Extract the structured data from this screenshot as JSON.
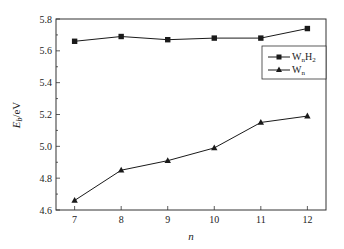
{
  "chart_data": {
    "type": "line",
    "title": "",
    "xlabel": "n",
    "ylabel": "E_b/eV",
    "x": [
      7,
      8,
      9,
      10,
      11,
      12
    ],
    "xlim": [
      6.6,
      12.4
    ],
    "ylim": [
      4.6,
      5.8
    ],
    "xticks": [
      "7",
      "8",
      "9",
      "10",
      "11",
      "12"
    ],
    "yticks": [
      "4.6",
      "4.8",
      "5.0",
      "5.2",
      "5.4",
      "5.6",
      "5.8"
    ],
    "grid": false,
    "legend_position": "upper right (inside)",
    "series": [
      {
        "name": "WnH2",
        "label_main": "W",
        "label_sub1": "n",
        "label_main2": "H",
        "label_sub2": "2",
        "marker": "square",
        "color": "#1a1a1a",
        "values": [
          5.66,
          5.69,
          5.67,
          5.68,
          5.68,
          5.74
        ]
      },
      {
        "name": "Wn",
        "label_main": "W",
        "label_sub1": "n",
        "marker": "triangle",
        "color": "#1a1a1a",
        "values": [
          4.66,
          4.85,
          4.91,
          4.99,
          5.15,
          5.19
        ]
      }
    ]
  }
}
